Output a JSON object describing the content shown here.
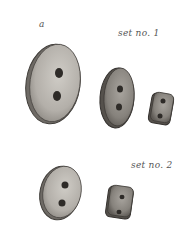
{
  "illustration": {
    "subject": "sewing buttons",
    "labels": {
      "a": "a",
      "set1": "set no. 1",
      "set2": "set no. 2"
    },
    "sets": [
      {
        "name": "set no. 1",
        "buttons": [
          "large oval two-hole button",
          "medium oval two-hole button",
          "small square two-hole button"
        ]
      },
      {
        "name": "set no. 2",
        "buttons": [
          "medium oval two-hole button",
          "small square two-hole button"
        ]
      }
    ],
    "colors": {
      "button_face": "#b9b6b0",
      "button_face_dark": "#8f8b85",
      "outline": "#3f3c38",
      "hole": "#2e2b28",
      "label": "#555555"
    }
  }
}
